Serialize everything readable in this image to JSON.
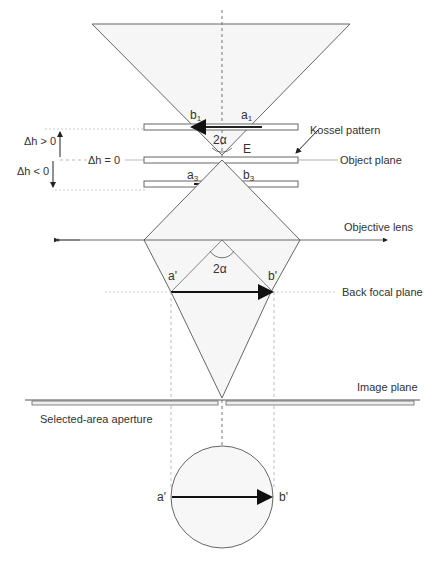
{
  "labels": {
    "kossel_pattern": "Kossel pattern",
    "object_plane": "Object plane",
    "objective_lens": "Objective lens",
    "back_focal_plane": "Back focal plane",
    "image_plane": "Image plane",
    "selected_area_aperture": "Selected-area aperture",
    "dh_pos": "Δh > 0",
    "dh_zero": "Δh = 0",
    "dh_neg": "Δh < 0",
    "two_alpha_top": "2α",
    "two_alpha_mid": "2α",
    "E": "E",
    "b1": "b",
    "b1_sub": "1",
    "a1": "a",
    "a1_sub": "1",
    "a3": "a",
    "a3_sub": "3",
    "b3": "b",
    "b3_sub": "3",
    "a_prime_mid": "a'",
    "b_prime_mid": "b'",
    "a_prime_bottom": "a'",
    "b_prime_bottom": "b'"
  },
  "colors": {
    "line": "#555555",
    "dashed": "#777777",
    "fill": "#f7f7f7",
    "arrow": "#111111"
  }
}
